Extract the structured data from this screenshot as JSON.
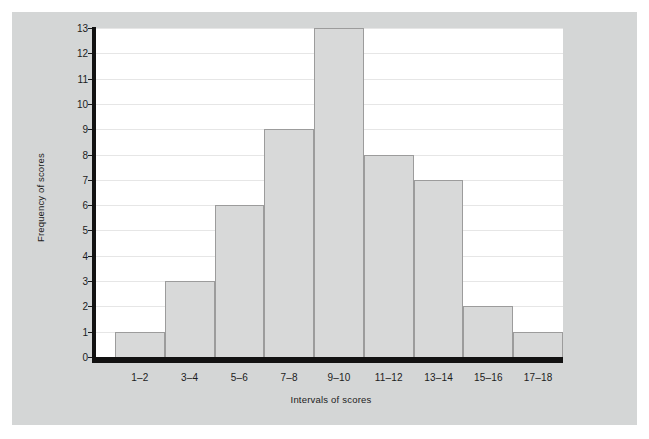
{
  "figure": {
    "background_color": "#d4d6d6",
    "plot_background_color": "#ffffff",
    "axis_color": "#121212",
    "bar_fill_color": "#d8d9d9",
    "bar_border_color": "#9c9c9c",
    "gridline_color": "#e6e6e6"
  },
  "chart_data": {
    "type": "bar",
    "title": "",
    "subtitle": "",
    "xlabel": "Intervals of scores",
    "ylabel": "Frequency of scores",
    "categories": [
      "1–2",
      "3–4",
      "5–6",
      "7–8",
      "9–10",
      "11–12",
      "13–14",
      "15–16",
      "17–18"
    ],
    "values": [
      1,
      3,
      6,
      9,
      13,
      8,
      7,
      2,
      1
    ],
    "ylim": [
      0,
      13
    ],
    "ytick_labels": [
      "0",
      "1",
      "2",
      "3",
      "4",
      "5",
      "6",
      "7",
      "8",
      "9",
      "10",
      "11",
      "12",
      "13"
    ],
    "ytick_values": [
      0,
      1,
      2,
      3,
      4,
      5,
      6,
      7,
      8,
      9,
      10,
      11,
      12,
      13
    ],
    "grid": "horizontal",
    "legend": "none",
    "bar_gap": 0,
    "annotations": []
  }
}
